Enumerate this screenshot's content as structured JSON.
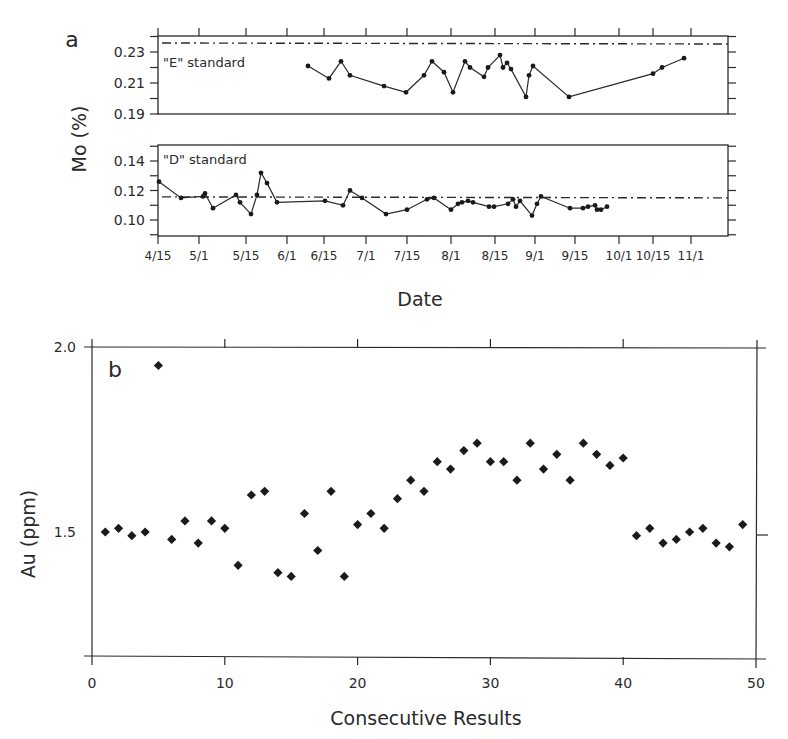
{
  "figure": {
    "panel_a_label": "a",
    "panel_b_label": "b",
    "panel_a_ylabel": "Mo (%)",
    "panel_a_xlabel": "Date",
    "panel_b_ylabel": "Au (ppm)",
    "panel_b_xlabel": "Consecutive Results",
    "e_standard_label": "\"E\" standard",
    "d_standard_label": "\"D\" standard",
    "colors": {
      "ink": "#2a2a2a",
      "background": "#ffffff"
    }
  },
  "chart_data": [
    {
      "type": "line",
      "title": "\"E\" standard",
      "panel": "a-top",
      "xlabel": "Date",
      "ylabel": "Mo (%)",
      "ylim": [
        0.19,
        0.24
      ],
      "yticks": [
        0.19,
        0.21,
        0.23
      ],
      "yticklabels": [
        "0.19",
        "0.21",
        "0.23"
      ],
      "reference_line": 0.235,
      "x_ticks": [
        "4/15",
        "5/1",
        "5/15",
        "6/1",
        "6/15",
        "7/1",
        "7/15",
        "8/1",
        "8/15",
        "9/1",
        "9/15",
        "10/1",
        "10/15",
        "11/1"
      ],
      "x_tick_px": [
        158,
        199,
        246,
        287,
        324,
        366,
        407,
        451,
        495,
        535,
        575,
        619,
        653,
        691
      ],
      "points_px_x": [
        308,
        329,
        341,
        350,
        384,
        406,
        424,
        432,
        444,
        453,
        465,
        470,
        484,
        488,
        500,
        503,
        507,
        511,
        526,
        529,
        533,
        569,
        653,
        662,
        684
      ],
      "values": [
        0.221,
        0.213,
        0.224,
        0.215,
        0.208,
        0.204,
        0.215,
        0.224,
        0.217,
        0.204,
        0.224,
        0.22,
        0.214,
        0.22,
        0.228,
        0.22,
        0.223,
        0.219,
        0.201,
        0.215,
        0.221,
        0.201,
        0.216,
        0.22,
        0.226
      ],
      "grid": false
    },
    {
      "type": "line",
      "title": "\"D\" standard",
      "panel": "a-bottom",
      "xlabel": "Date",
      "ylabel": "Mo (%)",
      "ylim": [
        0.09,
        0.15
      ],
      "yticks": [
        0.1,
        0.12,
        0.14
      ],
      "yticklabels": [
        "0.10",
        "0.12",
        "0.14"
      ],
      "reference_line": 0.115,
      "x_ticks": [
        "4/15",
        "5/1",
        "5/15",
        "6/1",
        "6/15",
        "7/1",
        "7/15",
        "8/1",
        "8/15",
        "9/1",
        "9/15",
        "10/1",
        "10/15",
        "11/1"
      ],
      "x_tick_px": [
        158,
        199,
        246,
        287,
        324,
        366,
        407,
        451,
        495,
        535,
        575,
        619,
        653,
        691
      ],
      "points_px_x": [
        159,
        181,
        203,
        205,
        213,
        236,
        240,
        251,
        257,
        261,
        267,
        277,
        325,
        343,
        350,
        362,
        386,
        407,
        427,
        434,
        451,
        458,
        462,
        468,
        473,
        489,
        494,
        508,
        513,
        516,
        520,
        532,
        537,
        541,
        570,
        583,
        588,
        595,
        597,
        601,
        607
      ],
      "values": [
        0.126,
        0.115,
        0.116,
        0.118,
        0.108,
        0.117,
        0.112,
        0.104,
        0.117,
        0.132,
        0.125,
        0.112,
        0.113,
        0.11,
        0.12,
        0.115,
        0.104,
        0.107,
        0.114,
        0.115,
        0.107,
        0.111,
        0.112,
        0.113,
        0.112,
        0.109,
        0.109,
        0.111,
        0.114,
        0.109,
        0.113,
        0.103,
        0.111,
        0.116,
        0.108,
        0.108,
        0.109,
        0.11,
        0.107,
        0.107,
        0.109
      ],
      "grid": false
    },
    {
      "type": "scatter",
      "title": "",
      "panel": "b",
      "xlabel": "Consecutive Results",
      "ylabel": "Au (ppm)",
      "xlim": [
        0,
        50
      ],
      "ylim": [
        1.16,
        2.0
      ],
      "xticks": [
        0,
        10,
        20,
        30,
        40,
        50
      ],
      "xticklabels": [
        "0",
        "10",
        "20",
        "30",
        "40",
        "50"
      ],
      "yticks": [
        1.5,
        2.0
      ],
      "yticklabels": [
        "1.5",
        "2.0"
      ],
      "x": [
        1,
        2,
        3,
        4,
        5,
        6,
        7,
        8,
        9,
        10,
        11,
        12,
        13,
        14,
        15,
        16,
        17,
        18,
        19,
        20,
        21,
        22,
        23,
        24,
        25,
        26,
        27,
        28,
        29,
        30,
        31,
        32,
        33,
        34,
        35,
        36,
        37,
        38,
        39,
        40,
        41,
        42,
        43,
        44,
        45,
        46,
        47,
        48,
        49
      ],
      "values": [
        1.5,
        1.51,
        1.49,
        1.5,
        1.95,
        1.48,
        1.53,
        1.47,
        1.53,
        1.51,
        1.41,
        1.6,
        1.61,
        1.39,
        1.38,
        1.55,
        1.45,
        1.61,
        1.38,
        1.52,
        1.55,
        1.51,
        1.59,
        1.64,
        1.61,
        1.69,
        1.67,
        1.72,
        1.74,
        1.69,
        1.69,
        1.64,
        1.74,
        1.67,
        1.71,
        1.64,
        1.74,
        1.71,
        1.68,
        1.7,
        1.49,
        1.51,
        1.47,
        1.48,
        1.5,
        1.51,
        1.47,
        1.46,
        1.52
      ],
      "marker": "diamond",
      "grid": false
    }
  ]
}
